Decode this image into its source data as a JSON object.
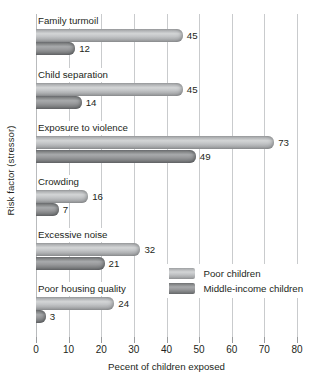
{
  "chart_data": {
    "type": "bar",
    "orientation": "horizontal",
    "title": "",
    "xlabel": "Pecent of children exposed",
    "ylabel": "Risk factor (stressor)",
    "xlim": [
      0,
      80
    ],
    "xticks": [
      0,
      10,
      20,
      30,
      40,
      50,
      60,
      70,
      80
    ],
    "grid": true,
    "legend_position": "inside-bottom-right",
    "categories": [
      "Family turmoil",
      "Child separation",
      "Exposure to violence",
      "Crowding",
      "Excessive noise",
      "Poor housing quality"
    ],
    "series": [
      {
        "name": "Poor children",
        "color": "#c2c4c6",
        "values": [
          45,
          45,
          73,
          16,
          32,
          24
        ]
      },
      {
        "name": "Middle-income children",
        "color": "#98999b",
        "values": [
          12,
          14,
          49,
          7,
          21,
          3
        ]
      }
    ]
  },
  "axes": {
    "x_title": "Pecent of children exposed",
    "y_title": "Risk factor (stressor)",
    "x_tick_labels": [
      "0",
      "10",
      "20",
      "30",
      "40",
      "50",
      "60",
      "70",
      "80"
    ]
  },
  "legend": {
    "items": [
      {
        "label": "Poor children"
      },
      {
        "label": "Middle-income children"
      }
    ]
  },
  "colors": {
    "series_poor": "#c2c4c6",
    "series_middle": "#98999b",
    "gridline": "#c9cbcd",
    "text": "#231f20",
    "background": "#ffffff"
  }
}
